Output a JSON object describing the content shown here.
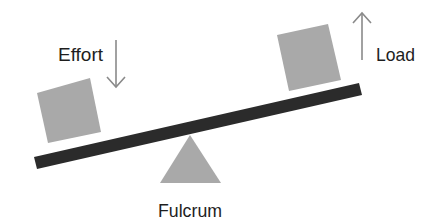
{
  "diagram": {
    "type": "lever",
    "labels": {
      "effort": "Effort",
      "load": "Load",
      "fulcrum": "Fulcrum"
    },
    "colors": {
      "background": "#ffffff",
      "lever": "#2b2b2b",
      "boxes": "#a9a9a9",
      "fulcrum": "#a9a9a9",
      "arrows": "#8a8a8a",
      "text": "#1e1e1e"
    },
    "arrows": {
      "effort": "down",
      "load": "up"
    }
  }
}
